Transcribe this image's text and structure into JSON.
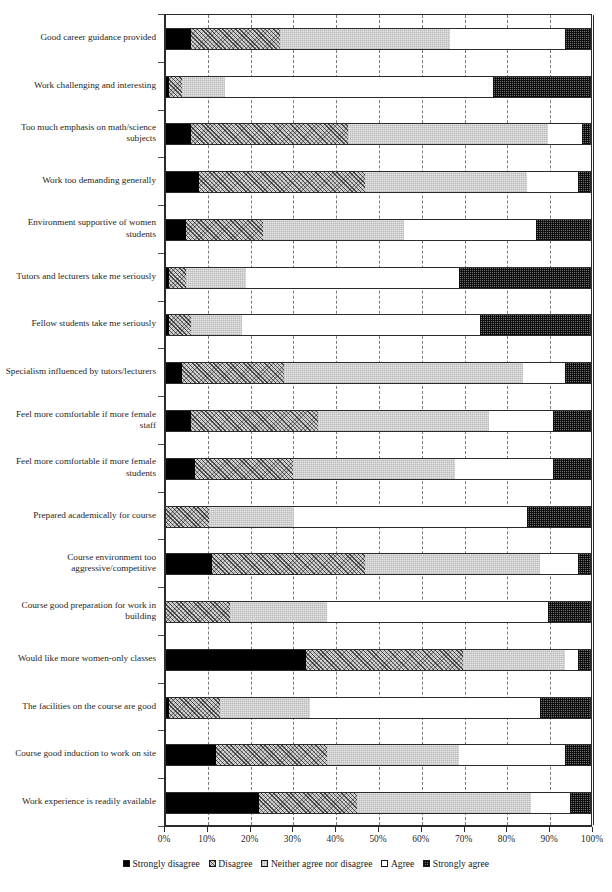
{
  "chart_data": {
    "type": "bar",
    "orientation": "horizontal",
    "stacked": true,
    "stacked_normalized": true,
    "title": "",
    "xlabel": "",
    "ylabel": "",
    "xlim": [
      0,
      100
    ],
    "xtick_labels": [
      "0%",
      "10%",
      "20%",
      "30%",
      "40%",
      "50%",
      "60%",
      "70%",
      "80%",
      "90%",
      "100%"
    ],
    "xtick_values": [
      0,
      10,
      20,
      30,
      40,
      50,
      60,
      70,
      80,
      90,
      100
    ],
    "grid": "vertical-dashed",
    "legend_position": "bottom-center",
    "legend": [
      "Strongly disagree",
      "Disagree",
      "Neither agree nor disagree",
      "Agree",
      "Strongly agree"
    ],
    "series": [
      {
        "name": "Strongly disagree",
        "pattern": "solid-black",
        "values": [
          6,
          1,
          6,
          8,
          5,
          1,
          1,
          4,
          6,
          7,
          0,
          11,
          0,
          33,
          1,
          12,
          22
        ]
      },
      {
        "name": "Disagree",
        "pattern": "diagonal-crosshatch",
        "values": [
          21,
          3,
          37,
          39,
          18,
          4,
          5,
          24,
          30,
          23,
          10,
          36,
          15,
          37,
          12,
          26,
          23
        ]
      },
      {
        "name": "Neither agree nor disagree",
        "pattern": "light-stipple",
        "values": [
          40,
          10,
          47,
          38,
          33,
          14,
          12,
          56,
          40,
          38,
          20,
          41,
          23,
          24,
          21,
          31,
          41
        ]
      },
      {
        "name": "Agree",
        "pattern": "white",
        "values": [
          27,
          63,
          8,
          12,
          31,
          50,
          56,
          10,
          15,
          23,
          55,
          9,
          52,
          3,
          54,
          25,
          9
        ]
      },
      {
        "name": "Strongly agree",
        "pattern": "dark-checker",
        "values": [
          6,
          23,
          2,
          3,
          13,
          31,
          26,
          6,
          9,
          9,
          15,
          3,
          10,
          3,
          12,
          6,
          5
        ]
      }
    ],
    "categories": [
      "Good career guidance provided",
      "Work challenging and interesting",
      "Too much emphasis on math/science subjects",
      "Work too demanding generally",
      "Environment supportive of women students",
      "Tutors and lecturers take me seriously",
      "Fellow students take me seriously",
      "Specialism influenced by tutors/lecturers",
      "Feel more comfortable if more female staff",
      "Feel more comfortable if more female students",
      "Prepared academically for course",
      "Course environment too aggressive/competitive",
      "Course good preparation for work in building",
      "Would like more women-only classes",
      "The facilities on the course are good",
      "Course good induction to work on site",
      "Work experience is readily available"
    ]
  }
}
